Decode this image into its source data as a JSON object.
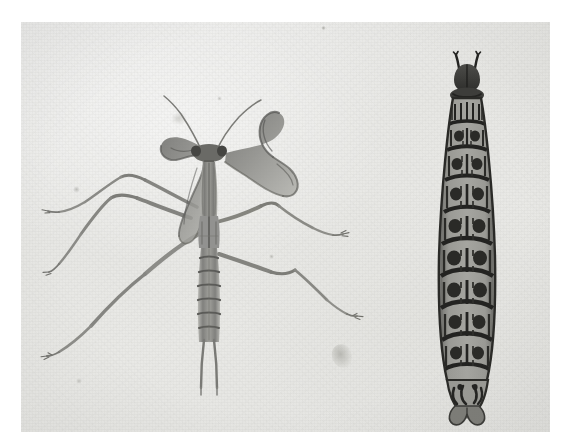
{
  "image": {
    "title": "Antique natural-history plate: praying mantis and caterpillar larva",
    "medium": "watercolour and ink on aged paper, photographic reproduction",
    "width_px": 565,
    "height_px": 448,
    "border": {
      "color": "#ffffff",
      "left_px": 21,
      "top_px": 22,
      "right_px": 15,
      "bottom_px": 16
    },
    "paper": {
      "base_color": "#e8e8e5",
      "highlight_color": "#f2f2f0",
      "shadow_color": "#dcdcd8"
    }
  },
  "specimens": [
    {
      "id": "mantis",
      "common_name": "praying mantis",
      "position": "left",
      "orientation": "dorsal view, head up",
      "ink_color": "#6e6e6c",
      "dark_ink_color": "#4a4a48",
      "parts": [
        "triangular head",
        "two compound eyes",
        "pair of filiform antennae",
        "raptorial forelegs (curved, blade-like)",
        "elongate pronotum",
        "segmented abdomen with transverse banding",
        "two cerci",
        "two pairs of long walking legs"
      ],
      "bbox": {
        "x": 60,
        "y": 88,
        "width": 285,
        "height": 282
      }
    },
    {
      "id": "larva",
      "common_name": "caterpillar larva",
      "position": "right",
      "orientation": "dorsal view, head up",
      "ink_color": "#2c2c2a",
      "body_fill": "#8d8d88",
      "segment_count": 11,
      "parts": [
        "dark rounded head capsule",
        "pair of short horn-like projections",
        "eleven tapering body segments",
        "paired dark tubercles per segment",
        "lateral tufts of setae",
        "forked anal claspers"
      ],
      "bbox": {
        "x": 411,
        "y": 57,
        "width": 70,
        "height": 348
      }
    }
  ],
  "artifacts": [
    {
      "name": "foxing-stain",
      "x": 338,
      "y": 352,
      "size": 18,
      "color": "#b9b9b3"
    },
    {
      "name": "paper-speck-upper-left",
      "x": 176,
      "y": 118,
      "size": 11,
      "color": "#cfcfc9"
    },
    {
      "name": "paper-speck-left-margin",
      "x": 76,
      "y": 190,
      "size": 7,
      "color": "#cdcdc7"
    },
    {
      "name": "paper-speck-lower-left",
      "x": 78,
      "y": 380,
      "size": 6,
      "color": "#d2d2cc"
    },
    {
      "name": "paper-speck-upper-centre",
      "x": 322,
      "y": 27,
      "size": 4,
      "color": "#c8c8c2"
    },
    {
      "name": "paper-speck-right",
      "x": 270,
      "y": 258,
      "size": 4,
      "color": "#cbcbc5"
    }
  ]
}
